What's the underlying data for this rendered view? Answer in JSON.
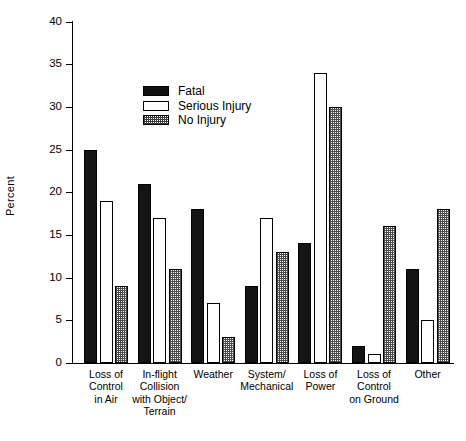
{
  "chart_data": {
    "type": "bar",
    "title": "",
    "xlabel": "",
    "ylabel": "Percent",
    "ylim": [
      0,
      40
    ],
    "yticks": [
      0,
      5,
      10,
      15,
      20,
      25,
      30,
      35,
      40
    ],
    "grid": false,
    "legend_position": "upper-center-left",
    "categories": [
      "Loss of\nControl\nin Air",
      "In-flight\nCollision\nwith Object/\nTerrain",
      "Weather",
      "System/\nMechanical",
      "Loss of\nPower",
      "Loss of\nControl\non Ground",
      "Other"
    ],
    "series": [
      {
        "name": "Fatal",
        "values": [
          25,
          21,
          18,
          9,
          14,
          2,
          11
        ],
        "color": "#141414",
        "fill": "solid"
      },
      {
        "name": "Serious Injury",
        "values": [
          19,
          17,
          7,
          17,
          34,
          1,
          5
        ],
        "color": "#ffffff",
        "fill": "open"
      },
      {
        "name": "No Injury",
        "values": [
          9,
          11,
          3,
          13,
          30,
          16,
          18
        ],
        "color": "#4a4a4a",
        "fill": "checkered"
      }
    ]
  },
  "axis": {
    "y_title": "Percent",
    "y_tick_labels": [
      "40",
      "35",
      "30",
      "25",
      "20",
      "15",
      "10",
      "5",
      "0"
    ]
  },
  "legend": {
    "items": [
      {
        "label": "Fatal"
      },
      {
        "label": "Serious Injury"
      },
      {
        "label": "No Injury"
      }
    ]
  },
  "caption": {
    "text": ""
  }
}
